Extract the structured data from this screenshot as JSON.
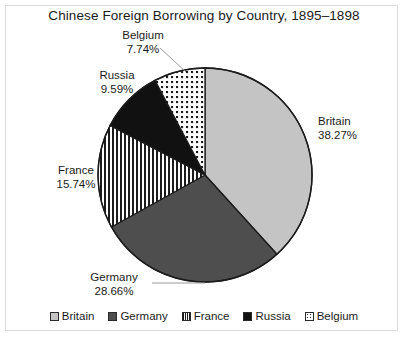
{
  "chart_data": {
    "type": "pie",
    "title": "Chinese Foreign Borrowing by Country, 1895–1898",
    "xlabel": "",
    "ylabel": "",
    "legend_position": "bottom",
    "grid": false,
    "start_angle_deg": 0,
    "direction": "clockwise",
    "categories": [
      "Britain",
      "Germany",
      "France",
      "Russia",
      "Belgium"
    ],
    "values": [
      38.27,
      28.66,
      15.74,
      9.59,
      7.74
    ],
    "unit": "%",
    "slices": [
      {
        "name": "Britain",
        "value": 38.27,
        "label": "Britain",
        "value_label": "38.27%",
        "fill_style": "solid-light-gray",
        "color": "#c4c4c4",
        "leader_line": false
      },
      {
        "name": "Germany",
        "value": 28.66,
        "label": "Germany",
        "value_label": "28.66%",
        "fill_style": "solid-dark-gray",
        "color": "#4e4e4e",
        "leader_line": true
      },
      {
        "name": "France",
        "value": 15.74,
        "label": "France",
        "value_label": "15.74%",
        "fill_style": "vertical-stripes",
        "color": "#1b1b1b",
        "leader_line": false
      },
      {
        "name": "Russia",
        "value": 9.59,
        "label": "Russia",
        "value_label": "9.59%",
        "fill_style": "solid-black",
        "color": "#111111",
        "leader_line": false
      },
      {
        "name": "Belgium",
        "value": 7.74,
        "label": "Belgium",
        "value_label": "7.74%",
        "fill_style": "dotted",
        "color": "#1b1b1b",
        "leader_line": true
      }
    ],
    "legend": [
      {
        "label": "Britain"
      },
      {
        "label": "Germany"
      },
      {
        "label": "France"
      },
      {
        "label": "Russia"
      },
      {
        "label": "Belgium"
      }
    ]
  },
  "colors": {
    "britain": "#c4c4c4",
    "germany": "#4e4e4e",
    "france": "#1b1b1b",
    "russia": "#111111",
    "belgium": "#1b1b1b",
    "outline": "#1b1b1b",
    "background": "#ffffff",
    "frame": "#dcdcdc",
    "text": "#1b1b1b"
  }
}
